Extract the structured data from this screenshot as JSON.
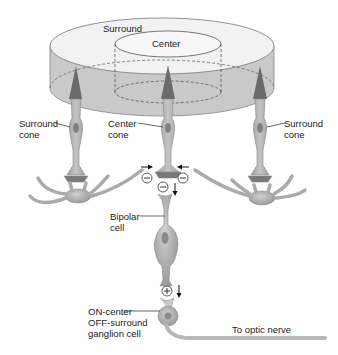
{
  "diagram": {
    "colors": {
      "disk_top": "#f2f2f2",
      "disk_side": "#c8c8c8",
      "cell_fill": "#b4b4b4",
      "cell_stroke": "#8c8c8c",
      "cone_outer_segment": "#6a6a6a",
      "text": "#222222"
    },
    "labels": {
      "surround": "Surround",
      "center": "Center",
      "surround_cone_left": [
        "Surround",
        "cone"
      ],
      "center_cone": [
        "Center",
        "cone"
      ],
      "surround_cone_right": [
        "Surround",
        "cone"
      ],
      "bipolar_cell": [
        "Bipolar",
        "cell"
      ],
      "ganglion_cell": [
        "ON-center",
        "OFF-surround",
        "ganglion cell"
      ],
      "optic_nerve": "To optic nerve"
    },
    "synapse_signs": {
      "left_horizontal": "−",
      "right_horizontal": "−",
      "cone_to_bipolar": "−",
      "bipolar_to_ganglion": "+"
    },
    "arrows": [
      "right-pointing (left input)",
      "left-pointing (right input)",
      "down (to bipolar)",
      "down (to ganglion)"
    ]
  }
}
